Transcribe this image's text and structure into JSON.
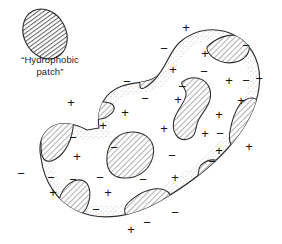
{
  "figure": {
    "background_color": "#ffffff",
    "ink_color": "#1d1d1d",
    "stipple_color": "#c9c9c9",
    "hatch_color": "#6e6e6e",
    "width": 282,
    "height": 244
  },
  "legend": {
    "label": "“Hydrophobic\npatch”",
    "swatch_name": "hatched-ellipse-swatch"
  },
  "chart_data": {
    "type": "diagram",
    "title": "Hydrophobic patch",
    "legend": [
      {
        "symbol": "diagonal-hatch",
        "meaning": "“Hydrophobic patch”"
      },
      {
        "symbol": "+",
        "meaning": "positive charge"
      },
      {
        "symbol": "−",
        "meaning": "negative charge"
      }
    ],
    "counts": {
      "plus_signs": 21,
      "minus_signs": 28,
      "hatched_patches_on_body": 12,
      "legend_patches": 1
    },
    "blob_outline": "M 99 128 C 96 108 105 92 122 86 C 136 81 147 84 156 77 C 166 69 168 53 180 42 C 196 28 218 26 236 36 C 254 46 262 66 259 88 C 256 110 244 130 228 148 C 210 168 186 186 160 201 C 132 217 102 222 78 211 C 56 201 44 181 41 158 C 38 144 42 134 50 128 C 60 120 76 124 87 130 Z",
    "patches": [
      {
        "name": "legend-ellipse",
        "cx": 45,
        "cy": 34,
        "rx": 21,
        "ry": 26,
        "rotate": -28,
        "hatch": "horizontal"
      },
      {
        "name": "patch-notch-upper-left",
        "path": "M 140 83 C 136 72 142 58 152 50 C 161 43 167 46 164 58 C 161 72 152 82 144 86 C 140 88 141 86 140 83 Z"
      },
      {
        "name": "patch-top-right-edge",
        "path": "M 211 44 C 221 36 235 34 243 40 C 250 46 247 56 238 59 C 226 63 214 58 210 51 C 208 47 209 45 211 44 Z"
      },
      {
        "name": "patch-right-upper-rim",
        "path": "M 240 106 C 248 98 256 98 256 108 C 256 122 248 136 238 142 C 231 146 229 140 231 131 C 233 120 236 111 240 106 Z"
      },
      {
        "name": "patch-right-lower-rim",
        "path": "M 203 166 C 210 160 218 160 219 167 C 220 176 213 184 205 186 C 199 187 197 182 199 175 C 200 171 201 168 203 166 Z"
      },
      {
        "name": "patch-center-vertical-bean",
        "path": "M 183 83 C 193 76 205 79 208 90 C 211 101 204 109 199 117 C 194 126 197 134 189 137 C 180 140 173 132 175 121 C 177 110 184 104 185 96 C 186 90 181 86 183 83 Z"
      },
      {
        "name": "patch-center-bean",
        "path": "M 110 154 C 112 141 124 134 138 136 C 150 138 155 147 152 158 C 149 169 139 176 126 176 C 114 176 108 166 110 154 Z"
      },
      {
        "name": "patch-left-edge",
        "path": "M 44 140 C 44 125 52 113 62 110 C 70 108 74 115 72 128 C 70 143 62 156 52 159 C 44 161 44 150 44 140 Z"
      },
      {
        "name": "patch-upper-left-small",
        "path": "M 84 108 C 92 102 104 101 110 105 C 114 108 111 113 104 116 C 95 119 85 117 83 113 C 82 110 83 109 84 108 Z"
      },
      {
        "name": "patch-bottom-left",
        "path": "M 62 196 C 66 184 76 178 84 182 C 91 186 90 197 85 206 C 80 214 70 216 65 211 C 61 207 60 202 62 196 Z"
      },
      {
        "name": "patch-bottom-center",
        "path": "M 130 201 C 142 190 158 186 166 192 C 173 198 167 209 155 215 C 142 221 129 218 127 211 C 126 207 127 204 130 201 Z"
      }
    ],
    "charges": [
      {
        "sign": "+",
        "x": 186,
        "y": 27
      },
      {
        "sign": "−",
        "x": 164,
        "y": 48
      },
      {
        "sign": "−",
        "x": 246,
        "y": 45
      },
      {
        "sign": "+",
        "x": 205,
        "y": 53
      },
      {
        "sign": "+",
        "x": 173,
        "y": 69
      },
      {
        "sign": "−",
        "x": 204,
        "y": 71
      },
      {
        "sign": "−",
        "x": 127,
        "y": 81
      },
      {
        "sign": "+",
        "x": 229,
        "y": 80
      },
      {
        "sign": "−",
        "x": 246,
        "y": 80
      },
      {
        "sign": "−",
        "x": 259,
        "y": 78
      },
      {
        "sign": "−",
        "x": 182,
        "y": 86
      },
      {
        "sign": "+",
        "x": 71,
        "y": 102
      },
      {
        "sign": "−",
        "x": 145,
        "y": 98
      },
      {
        "sign": "+",
        "x": 178,
        "y": 99
      },
      {
        "sign": "+",
        "x": 241,
        "y": 100
      },
      {
        "sign": "+",
        "x": 125,
        "y": 112
      },
      {
        "sign": "+",
        "x": 219,
        "y": 114
      },
      {
        "sign": "+",
        "x": 103,
        "y": 125
      },
      {
        "sign": "−",
        "x": 220,
        "y": 133
      },
      {
        "sign": "+",
        "x": 164,
        "y": 128
      },
      {
        "sign": "−",
        "x": 73,
        "y": 137
      },
      {
        "sign": "+",
        "x": 205,
        "y": 133
      },
      {
        "sign": "−",
        "x": 114,
        "y": 147
      },
      {
        "sign": "+",
        "x": 249,
        "y": 146
      },
      {
        "sign": "−",
        "x": 172,
        "y": 155
      },
      {
        "sign": "+",
        "x": 219,
        "y": 150
      },
      {
        "sign": "+",
        "x": 77,
        "y": 156
      },
      {
        "sign": "−",
        "x": 21,
        "y": 173
      },
      {
        "sign": "−",
        "x": 51,
        "y": 177
      },
      {
        "sign": "−",
        "x": 73,
        "y": 179
      },
      {
        "sign": "−",
        "x": 100,
        "y": 177
      },
      {
        "sign": "−",
        "x": 143,
        "y": 179
      },
      {
        "sign": "−",
        "x": 212,
        "y": 161
      },
      {
        "sign": "+",
        "x": 175,
        "y": 177
      },
      {
        "sign": "+",
        "x": 53,
        "y": 192
      },
      {
        "sign": "+",
        "x": 108,
        "y": 192
      },
      {
        "sign": "−",
        "x": 96,
        "y": 209
      },
      {
        "sign": "−",
        "x": 175,
        "y": 212
      },
      {
        "sign": "−",
        "x": 147,
        "y": 222
      },
      {
        "sign": "+",
        "x": 131,
        "y": 229
      }
    ]
  }
}
